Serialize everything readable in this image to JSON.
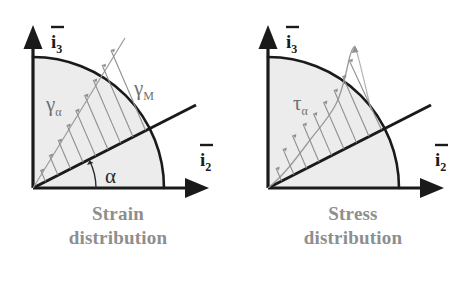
{
  "figure": {
    "background_color": "#ffffff",
    "panels": [
      {
        "id": "strain",
        "caption_line1": "Strain",
        "caption_line2": "distribution",
        "caption_color": "#8e8e8e",
        "axes": {
          "vertical_label_base": "i",
          "vertical_label_sub": "3",
          "vertical_label_overbar": true,
          "horizontal_label_base": "i",
          "horizontal_label_sub": "2",
          "horizontal_label_overbar": true,
          "axis_color": "#1a1a1a"
        },
        "sector": {
          "fill_color": "#ececec",
          "outline_color": "#1a1a1a",
          "radius_px": 132,
          "start_angle_deg": 0,
          "end_angle_deg": 90
        },
        "neutral_axis": {
          "name": "neutral-axis-line",
          "angle_label": "α",
          "angle_deg": 27,
          "color": "#1a1a1a"
        },
        "distribution": {
          "type": "linear",
          "label_main": "γ",
          "label_sub": "α",
          "envelope_label_main": "γ",
          "envelope_label_sub": "M",
          "arrow_color": "#8a8a8a",
          "arrow_count": 11,
          "description": "Linear strain distribution with arrows perpendicular to the neutral axis growing toward the arc"
        }
      },
      {
        "id": "stress",
        "caption_line1": "Stress",
        "caption_line2": "distribution",
        "caption_color": "#8e8e8e",
        "axes": {
          "vertical_label_base": "i",
          "vertical_label_sub": "3",
          "vertical_label_overbar": true,
          "horizontal_label_base": "i",
          "horizontal_label_sub": "2",
          "horizontal_label_overbar": true,
          "axis_color": "#1a1a1a"
        },
        "sector": {
          "fill_color": "#ececec",
          "outline_color": "#1a1a1a",
          "radius_px": 132,
          "start_angle_deg": 0,
          "end_angle_deg": 90
        },
        "neutral_axis": {
          "name": "neutral-axis-line",
          "angle_label": "",
          "angle_deg": 27,
          "color": "#1a1a1a"
        },
        "distribution": {
          "type": "nonlinear",
          "label_main": "τ",
          "label_sub": "α",
          "envelope_label_main": "",
          "envelope_label_sub": "",
          "arrow_color": "#8a8a8a",
          "arrow_count": 11,
          "description": "Nonlinear (plastic) stress distribution, S-shaped envelope peaking near the arc"
        }
      }
    ]
  }
}
